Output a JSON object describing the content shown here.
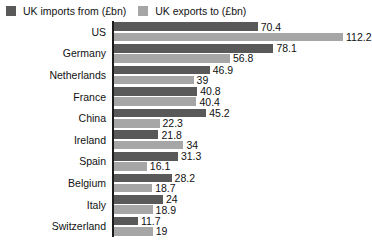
{
  "legend": {
    "position": "top-left",
    "entries": [
      {
        "label": "UK imports from (£bn)",
        "color": "#595959",
        "icon": "legend-swatch-icon"
      },
      {
        "label": "UK exports to (£bn)",
        "color": "#a6a6a6",
        "icon": "legend-swatch-icon"
      }
    ]
  },
  "chart_data": {
    "type": "bar",
    "orientation": "horizontal",
    "title": "",
    "subtitle": "",
    "xlabel": "",
    "ylabel": "",
    "grid": false,
    "legend_position": "top-left",
    "xlim": [
      0,
      112.2
    ],
    "categories": [
      "US",
      "Germany",
      "Netherlands",
      "France",
      "China",
      "Ireland",
      "Spain",
      "Belgium",
      "Italy",
      "Switzerland"
    ],
    "series": [
      {
        "name": "UK imports from (£bn)",
        "color": "#595959",
        "values": [
          70.4,
          78.1,
          46.9,
          40.8,
          45.2,
          21.8,
          31.3,
          28.2,
          24,
          11.7
        ],
        "labels": [
          "70.4",
          "78.1",
          "46.9",
          "40.8",
          "45.2",
          "21.8",
          "31.3",
          "28.2",
          "24",
          "11.7"
        ]
      },
      {
        "name": "UK exports to (£bn)",
        "color": "#a6a6a6",
        "values": [
          112.2,
          56.8,
          39,
          40.4,
          22.3,
          34,
          16.1,
          18.7,
          18.9,
          19
        ],
        "labels": [
          "112.2",
          "56.8",
          "39",
          "40.4",
          "22.3",
          "34",
          "16.1",
          "18.7",
          "18.9",
          "19"
        ]
      }
    ]
  }
}
